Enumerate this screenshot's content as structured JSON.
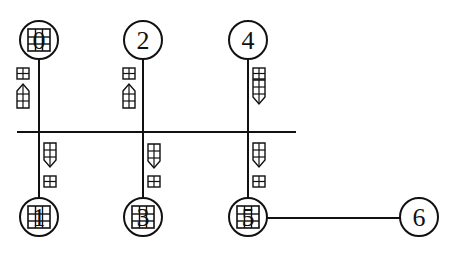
{
  "diagram": {
    "type": "graph",
    "stroke_color": "#111111",
    "background": "#ffffff",
    "nodes": [
      {
        "id": "0",
        "label": "0",
        "x": 39,
        "y": 40,
        "glyph_overlay": true
      },
      {
        "id": "2",
        "label": "2",
        "x": 143,
        "y": 40,
        "glyph_overlay": false
      },
      {
        "id": "4",
        "label": "4",
        "x": 248,
        "y": 40,
        "glyph_overlay": false
      },
      {
        "id": "1",
        "label": "1",
        "x": 39,
        "y": 217,
        "glyph_overlay": true
      },
      {
        "id": "3",
        "label": "3",
        "x": 143,
        "y": 217,
        "glyph_overlay": true
      },
      {
        "id": "5",
        "label": "5",
        "x": 248,
        "y": 217,
        "glyph_overlay": true
      },
      {
        "id": "6",
        "label": "6",
        "x": 419,
        "y": 217,
        "glyph_overlay": false
      }
    ],
    "bus": {
      "x1": 17,
      "x2": 296,
      "y": 132
    },
    "edges": [
      {
        "from": "0",
        "to": "bus",
        "arrow": "up",
        "label": "□ ↑"
      },
      {
        "from": "2",
        "to": "bus",
        "arrow": "up",
        "label": "□ ↑"
      },
      {
        "from": "4",
        "to": "bus",
        "arrow": "down",
        "label": "□ ↓"
      },
      {
        "from": "bus",
        "to": "1",
        "arrow": "down",
        "label": "↓ □"
      },
      {
        "from": "bus",
        "to": "3",
        "arrow": "down",
        "label": "↓ □"
      },
      {
        "from": "bus",
        "to": "5",
        "arrow": "down",
        "label": "↓ □"
      },
      {
        "from": "5",
        "to": "6",
        "arrow": "none",
        "label": ""
      }
    ]
  }
}
